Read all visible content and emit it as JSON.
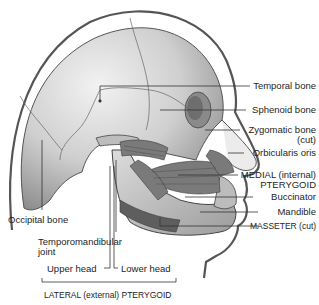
{
  "figure": {
    "labels_right": [
      {
        "id": "temporal-bone",
        "text": "Temporal bone"
      },
      {
        "id": "sphenoid-bone",
        "text": "Sphenoid bone"
      },
      {
        "id": "zygomatic-bone",
        "text": "Zygomatic bone",
        "text2": "(cut)"
      },
      {
        "id": "orbicularis-oris",
        "text": "Orbicularis oris"
      },
      {
        "id": "medial-pterygoid",
        "text": "MEDIAL (internal)",
        "text2": "PTERYGOID"
      },
      {
        "id": "buccinator",
        "text": "Buccinator"
      },
      {
        "id": "mandible",
        "text": "Mandible"
      },
      {
        "id": "masseter",
        "text": "MASSETER (cut)"
      }
    ],
    "labels_left": [
      {
        "id": "occipital-bone",
        "text": "Occipital bone"
      },
      {
        "id": "temporomandibular-joint",
        "text": "Temporomandibular",
        "text2": "joint"
      }
    ],
    "labels_bottom": [
      {
        "id": "upper-head",
        "text": "Upper head"
      },
      {
        "id": "lower-head",
        "text": "Lower head"
      },
      {
        "id": "lateral-pterygoid",
        "text": "LATERAL (external) PTERYGOID"
      }
    ],
    "colors": {
      "bone": "#d9d9d9",
      "bone_shadow": "#9a9a9a",
      "outline": "#444444",
      "muscle": "#6e6e6e",
      "leader": "#333333"
    }
  }
}
